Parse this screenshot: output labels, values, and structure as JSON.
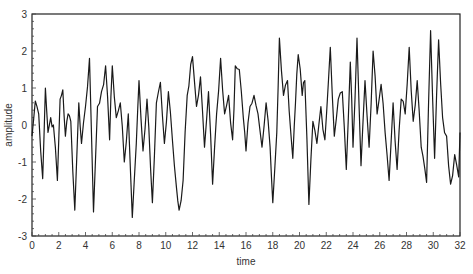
{
  "chart_data": {
    "type": "line",
    "title": "",
    "xlabel": "time",
    "ylabel": "amplitude",
    "xlim": [
      0,
      32
    ],
    "ylim": [
      -3,
      3
    ],
    "xticks": [
      0,
      2,
      4,
      6,
      8,
      10,
      12,
      14,
      16,
      18,
      20,
      22,
      24,
      26,
      28,
      30,
      32
    ],
    "yticks": [
      -3,
      -2,
      -1,
      0,
      1,
      2,
      3
    ],
    "grid": false,
    "legend": null,
    "line_color": "#1a1a1a",
    "series": [
      {
        "name": "amplitude",
        "x_step": 0.125,
        "keypoints": [
          [
            0.0,
            -0.3
          ],
          [
            0.25,
            0.65
          ],
          [
            0.5,
            0.3
          ],
          [
            0.8,
            -1.45
          ],
          [
            1.0,
            1.0
          ],
          [
            1.2,
            -0.2
          ],
          [
            1.4,
            0.2
          ],
          [
            1.6,
            0.0
          ],
          [
            1.9,
            -1.5
          ],
          [
            2.1,
            0.7
          ],
          [
            2.3,
            0.95
          ],
          [
            2.5,
            -0.3
          ],
          [
            2.7,
            0.3
          ],
          [
            2.9,
            0.1
          ],
          [
            3.2,
            -2.3
          ],
          [
            3.5,
            0.6
          ],
          [
            3.7,
            -0.5
          ],
          [
            4.0,
            0.5
          ],
          [
            4.3,
            1.8
          ],
          [
            4.6,
            -2.35
          ],
          [
            4.9,
            0.5
          ],
          [
            5.2,
            0.9
          ],
          [
            5.5,
            1.6
          ],
          [
            5.8,
            -0.4
          ],
          [
            6.0,
            1.6
          ],
          [
            6.3,
            0.2
          ],
          [
            6.6,
            0.6
          ],
          [
            6.9,
            -1.0
          ],
          [
            7.2,
            0.3
          ],
          [
            7.5,
            -2.5
          ],
          [
            7.8,
            -0.5
          ],
          [
            8.0,
            1.2
          ],
          [
            8.3,
            -0.7
          ],
          [
            8.6,
            0.7
          ],
          [
            9.0,
            -2.1
          ],
          [
            9.3,
            0.6
          ],
          [
            9.6,
            1.15
          ],
          [
            9.9,
            -0.5
          ],
          [
            10.2,
            0.9
          ],
          [
            10.5,
            -0.4
          ],
          [
            10.8,
            -1.7
          ],
          [
            11.0,
            -2.3
          ],
          [
            11.3,
            -1.5
          ],
          [
            11.6,
            0.8
          ],
          [
            12.0,
            1.85
          ],
          [
            12.3,
            0.5
          ],
          [
            12.6,
            1.3
          ],
          [
            12.9,
            -0.6
          ],
          [
            13.2,
            0.9
          ],
          [
            13.5,
            -1.6
          ],
          [
            13.8,
            0.3
          ],
          [
            14.1,
            1.8
          ],
          [
            14.4,
            0.3
          ],
          [
            14.7,
            0.8
          ],
          [
            15.0,
            -0.4
          ],
          [
            15.2,
            1.6
          ],
          [
            15.5,
            1.5
          ],
          [
            15.8,
            0.2
          ],
          [
            16.0,
            -0.7
          ],
          [
            16.3,
            0.5
          ],
          [
            16.6,
            0.8
          ],
          [
            16.9,
            0.3
          ],
          [
            17.2,
            -0.6
          ],
          [
            17.5,
            0.6
          ],
          [
            17.8,
            -0.6
          ],
          [
            18.0,
            -2.1
          ],
          [
            18.3,
            -0.2
          ],
          [
            18.5,
            2.35
          ],
          [
            18.8,
            0.8
          ],
          [
            19.1,
            1.2
          ],
          [
            19.5,
            -0.9
          ],
          [
            19.7,
            0.6
          ],
          [
            19.9,
            1.9
          ],
          [
            20.2,
            0.8
          ],
          [
            20.4,
            1.2
          ],
          [
            20.7,
            -2.15
          ],
          [
            21.0,
            0.1
          ],
          [
            21.3,
            -0.5
          ],
          [
            21.6,
            0.5
          ],
          [
            21.9,
            -0.4
          ],
          [
            22.3,
            2.1
          ],
          [
            22.6,
            -0.3
          ],
          [
            22.9,
            0.7
          ],
          [
            23.2,
            0.9
          ],
          [
            23.5,
            -1.2
          ],
          [
            23.8,
            1.7
          ],
          [
            24.0,
            -0.6
          ],
          [
            24.3,
            2.35
          ],
          [
            24.6,
            -1.1
          ],
          [
            24.9,
            1.2
          ],
          [
            25.2,
            -0.6
          ],
          [
            25.5,
            2.0
          ],
          [
            25.8,
            0.3
          ],
          [
            26.1,
            1.1
          ],
          [
            26.4,
            -0.2
          ],
          [
            26.7,
            -1.5
          ],
          [
            27.0,
            0.6
          ],
          [
            27.3,
            -1.2
          ],
          [
            27.6,
            0.7
          ],
          [
            27.9,
            0.3
          ],
          [
            28.2,
            2.1
          ],
          [
            28.5,
            0.1
          ],
          [
            28.8,
            1.2
          ],
          [
            29.1,
            -0.6
          ],
          [
            29.5,
            -1.55
          ],
          [
            29.8,
            2.55
          ],
          [
            30.1,
            -0.9
          ],
          [
            30.4,
            2.3
          ],
          [
            30.7,
            0.2
          ],
          [
            31.0,
            -0.3
          ],
          [
            31.3,
            -1.6
          ],
          [
            31.6,
            -0.8
          ],
          [
            31.9,
            -1.4
          ],
          [
            32.0,
            -0.2
          ]
        ]
      }
    ]
  }
}
